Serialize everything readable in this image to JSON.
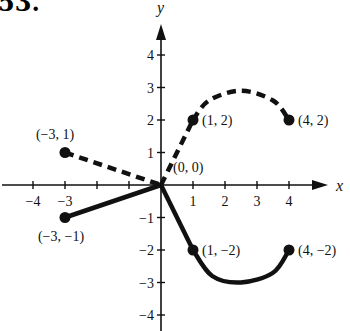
{
  "problem_number": "53.",
  "chart_data": {
    "type": "line",
    "title": "",
    "xlabel": "x",
    "ylabel": "y",
    "xlim": [
      -4.5,
      5
    ],
    "ylim": [
      -4.5,
      5
    ],
    "x_ticks": [
      -4,
      -3,
      -2,
      -1,
      1,
      2,
      3,
      4
    ],
    "x_tick_labels": [
      "−4",
      "−3",
      "",
      "",
      "1",
      "2",
      "3",
      "4"
    ],
    "y_ticks": [
      -4,
      -3,
      -2,
      -1,
      1,
      2,
      3,
      4
    ],
    "y_tick_labels": [
      "−4",
      "−3",
      "−2",
      "−1",
      "1",
      "2",
      "3",
      "4"
    ],
    "grid": false,
    "series": [
      {
        "name": "dashed-curve",
        "style": "dashed",
        "segments": [
          {
            "kind": "line",
            "points": [
              [
                -3,
                1
              ],
              [
                0,
                0
              ]
            ]
          },
          {
            "kind": "line",
            "points": [
              [
                0,
                0
              ],
              [
                1,
                2
              ]
            ]
          },
          {
            "kind": "curve",
            "points": [
              [
                1,
                2
              ],
              [
                1.5,
                2.6
              ],
              [
                2.5,
                2.9
              ],
              [
                3.5,
                2.6
              ],
              [
                4,
                2
              ]
            ]
          }
        ],
        "endpoints": [
          [
            -3,
            1
          ],
          [
            1,
            2
          ],
          [
            4,
            2
          ]
        ]
      },
      {
        "name": "solid-curve",
        "style": "solid",
        "segments": [
          {
            "kind": "line",
            "points": [
              [
                -3,
                -1
              ],
              [
                0,
                0
              ]
            ]
          },
          {
            "kind": "line",
            "points": [
              [
                0,
                0
              ],
              [
                1,
                -2
              ]
            ]
          },
          {
            "kind": "curve",
            "points": [
              [
                1,
                -2
              ],
              [
                1.6,
                -2.8
              ],
              [
                2.5,
                -3
              ],
              [
                3.5,
                -2.7
              ],
              [
                4,
                -2
              ]
            ]
          }
        ],
        "endpoints": [
          [
            -3,
            -1
          ],
          [
            1,
            -2
          ],
          [
            4,
            -2
          ]
        ]
      }
    ],
    "annotations": [
      {
        "text": "(−3, 1)",
        "at": [
          -3,
          1
        ]
      },
      {
        "text": "(1, 2)",
        "at": [
          1,
          2
        ]
      },
      {
        "text": "(4, 2)",
        "at": [
          4,
          2
        ]
      },
      {
        "text": "(0, 0)",
        "at": [
          0,
          0
        ]
      },
      {
        "text": "(−3, −1)",
        "at": [
          -3,
          -1
        ]
      },
      {
        "text": "(1, −2)",
        "at": [
          1,
          -2
        ]
      },
      {
        "text": "(4, −2)",
        "at": [
          4,
          -2
        ]
      }
    ]
  },
  "colors": {
    "ink": "#111111",
    "background": "#ffffff"
  }
}
